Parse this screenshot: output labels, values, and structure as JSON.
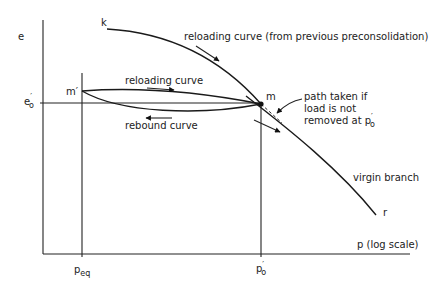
{
  "diagram": {
    "title": "",
    "axes": {
      "y_label": "e",
      "x_label": "p (log scale)"
    },
    "ticks": {
      "e0_main": "e",
      "e0_sub": "o",
      "peq_main": "p",
      "peq_sub": "eq",
      "p0_main": "p",
      "p0_sub": "o"
    },
    "points": {
      "k": "k",
      "m": "m",
      "m_prime": "m′",
      "r": "r"
    },
    "curve_labels": {
      "reloading_previous": "reloading curve (from previous preconsolidation)",
      "reloading": "reloading curve",
      "rebound": "rebound curve",
      "virgin": "virgin branch"
    },
    "annotation": {
      "line1": "path taken if",
      "line2": "load is not",
      "line3_main": "removed at p",
      "line3_sub": "o"
    }
  }
}
